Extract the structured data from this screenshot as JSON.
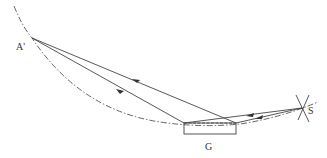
{
  "diagram": {
    "labels": {
      "image_point": "A'",
      "grating": "G",
      "source": "S"
    },
    "colors": {
      "line": "#444444",
      "dash": "#555555",
      "background": "#ffffff"
    }
  }
}
